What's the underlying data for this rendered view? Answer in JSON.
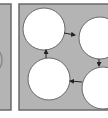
{
  "diagram": {
    "type": "cycle",
    "colors": {
      "background": "#ffffff",
      "panel_fill": "#b4b4b4",
      "panel_border": "#6a6a6a",
      "node_fill": "#ffffff",
      "node_border": "#6a6a6a",
      "arrow": "#222222"
    },
    "panels": [
      {
        "id": "left-panel",
        "x": -20,
        "y": 4,
        "w": 31,
        "h": 106
      },
      {
        "id": "main-panel",
        "x": 19,
        "y": 4,
        "w": 100,
        "h": 106
      }
    ],
    "nodes": [
      {
        "id": "node-1",
        "cx": 44,
        "cy": 29,
        "r": 21,
        "label": ""
      },
      {
        "id": "node-2",
        "cx": 100,
        "cy": 38,
        "r": 21,
        "label": ""
      },
      {
        "id": "node-3",
        "cx": 103,
        "cy": 88,
        "r": 21,
        "label": ""
      },
      {
        "id": "node-4",
        "cx": 49,
        "cy": 79,
        "r": 21,
        "label": ""
      }
    ],
    "edges": [
      {
        "from": "node-1",
        "to": "node-2",
        "x1": 64,
        "y1": 33,
        "x2": 75,
        "y2": 35
      },
      {
        "from": "node-2",
        "to": "node-3",
        "x1": 99,
        "y1": 59,
        "x2": 99,
        "y2": 66
      },
      {
        "from": "node-3",
        "to": "node-4",
        "x1": 82,
        "y1": 82,
        "x2": 70,
        "y2": 81
      },
      {
        "from": "node-4",
        "to": "node-1",
        "x1": 46,
        "y1": 58,
        "x2": 46,
        "y2": 50
      }
    ]
  }
}
